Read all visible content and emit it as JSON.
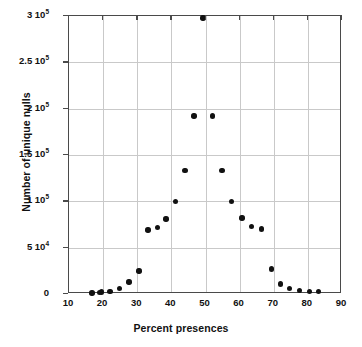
{
  "chart_data": {
    "type": "scatter",
    "title": "",
    "xlabel": "Percent presences",
    "ylabel": "Number of unique nulls",
    "xlim": [
      10,
      90
    ],
    "ylim": [
      0,
      300000
    ],
    "grid": true,
    "legend": "none",
    "xticks": [
      10,
      20,
      30,
      40,
      50,
      60,
      70,
      80,
      90
    ],
    "xtick_labels": [
      "10",
      "20",
      "30",
      "40",
      "50",
      "60",
      "70",
      "80",
      "90"
    ],
    "yticks": [
      0,
      50000,
      100000,
      150000,
      200000,
      250000,
      300000
    ],
    "ytick_labels": [
      {
        "mantissa": "0",
        "exponent": ""
      },
      {
        "mantissa": "5 10",
        "exponent": "4"
      },
      {
        "mantissa": "1 10",
        "exponent": "5"
      },
      {
        "mantissa": "1.5 10",
        "exponent": "5"
      },
      {
        "mantissa": "2 10",
        "exponent": "5"
      },
      {
        "mantissa": "2.5 10",
        "exponent": "5"
      },
      {
        "mantissa": "3 10",
        "exponent": "5"
      }
    ],
    "x": [
      16.7,
      19.0,
      19.6,
      22.0,
      24.8,
      27.6,
      30.5,
      33.1,
      35.9,
      38.4,
      41.2,
      44.0,
      46.6,
      49.3,
      52.0,
      54.8,
      57.6,
      60.7,
      63.5,
      66.4,
      69.3,
      72.0,
      74.7,
      77.6,
      80.4,
      83.2
    ],
    "y": [
      1000,
      1500,
      2000,
      3000,
      6000,
      13000,
      25000,
      69000,
      72000,
      81000,
      100000,
      133000,
      192000,
      298000,
      192000,
      133000,
      100000,
      82000,
      73000,
      70000,
      27000,
      11000,
      6000,
      4000,
      3000,
      2500
    ],
    "series_name": "unique nulls vs percent presences",
    "marker": "filled-circle",
    "marker_color": "#111111",
    "frame_color": "#4a4a4a",
    "grid_color": "#c9c9c9",
    "background_color": "#ffffff"
  },
  "geometry": {
    "plot_left": 68,
    "plot_top": 15,
    "plot_width": 273,
    "plot_height": 278
  }
}
